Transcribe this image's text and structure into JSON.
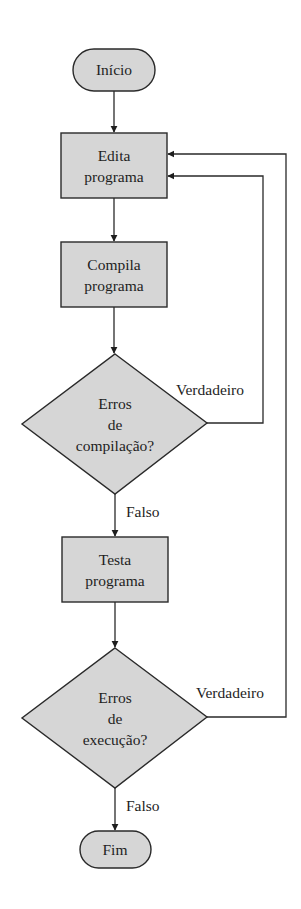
{
  "diagram": {
    "type": "flowchart",
    "colors": {
      "fill": "#d6d6d6",
      "stroke": "#2a2a2a",
      "text": "#1e1e1e",
      "background": "#ffffff"
    },
    "nodes": {
      "start": {
        "kind": "terminal",
        "lines": [
          "Início"
        ]
      },
      "edit": {
        "kind": "process",
        "lines": [
          "Edita",
          "programa"
        ]
      },
      "compile": {
        "kind": "process",
        "lines": [
          "Compila",
          "programa"
        ]
      },
      "compile_check": {
        "kind": "decision",
        "lines": [
          "Erros",
          "de",
          "compilação?"
        ]
      },
      "test": {
        "kind": "process",
        "lines": [
          "Testa",
          "programa"
        ]
      },
      "run_check": {
        "kind": "decision",
        "lines": [
          "Erros",
          "de",
          "execução?"
        ]
      },
      "end": {
        "kind": "terminal",
        "lines": [
          "Fim"
        ]
      }
    },
    "edges": {
      "compile_true": {
        "from": "compile_check",
        "to": "edit",
        "label": "Verdadeiro"
      },
      "compile_false": {
        "from": "compile_check",
        "to": "test",
        "label": "Falso"
      },
      "run_true": {
        "from": "run_check",
        "to": "edit",
        "label": "Verdadeiro"
      },
      "run_false": {
        "from": "run_check",
        "to": "end",
        "label": "Falso"
      }
    }
  }
}
